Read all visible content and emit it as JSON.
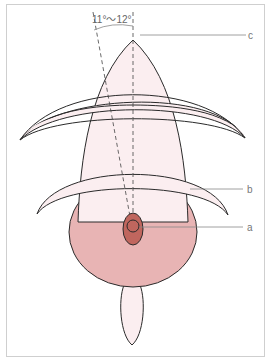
{
  "diagram": {
    "angle_label": "11°〜12°",
    "labels": {
      "a": "a",
      "b": "b",
      "c": "c"
    },
    "colors": {
      "light_fill": "#fbeef0",
      "body_fill": "#e8b4b4",
      "inner_fill": "#c0665e",
      "outline": "#2a2a2a",
      "leader": "#888888"
    }
  }
}
